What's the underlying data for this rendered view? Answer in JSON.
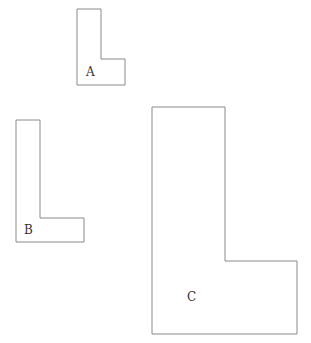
{
  "diagram": {
    "type": "similar-L-shapes",
    "colors": {
      "stroke": "#8a8a8a",
      "label": "#333333",
      "background": "#ffffff"
    },
    "shapes": [
      {
        "label": "A",
        "points": "77,9 101,9 101,59 125,59 125,85 77,85",
        "label_pos": [
          86,
          76
        ]
      },
      {
        "label": "B",
        "points": "16,120 40,120 40,218 84,218 84,242 16,242",
        "label_pos": [
          24,
          234
        ]
      },
      {
        "label": "C",
        "points": "152,107 225,107 225,261 297,261 297,334 152,334",
        "label_pos": [
          187,
          301
        ]
      }
    ]
  }
}
